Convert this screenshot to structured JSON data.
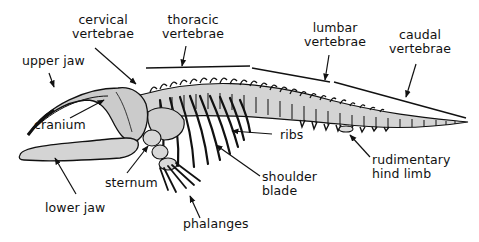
{
  "diagram": {
    "colors": {
      "ink": "#111111",
      "bone_fill": "#c9c9c9",
      "bone_fill_light": "#dcdcdc",
      "background": "#ffffff"
    },
    "labels": {
      "cervical_vertebrae": "cervical\nvertebrae",
      "thoracic_vertebrae": "thoracic\nvertebrae",
      "lumbar_vertebrae": "lumbar\nvertebrae",
      "caudal_vertebrae": "caudal\nvertebrae",
      "upper_jaw": "upper jaw",
      "cranium": "cranium",
      "ribs": "ribs",
      "rudimentary_hind_limb": "rudimentary\nhind limb",
      "shoulder_blade": "shoulder\nblade",
      "sternum": "sternum",
      "lower_jaw": "lower jaw",
      "phalanges": "phalanges"
    }
  }
}
